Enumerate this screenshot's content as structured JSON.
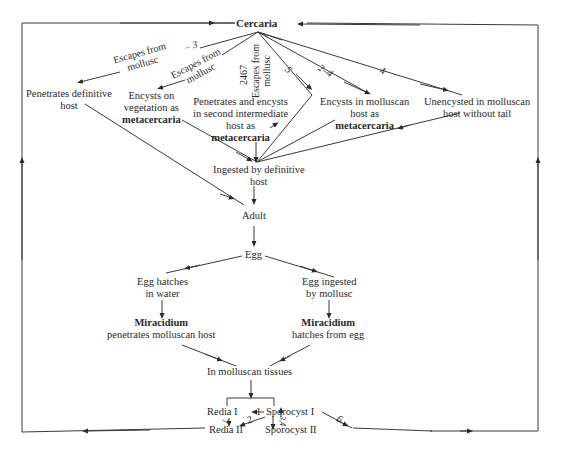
{
  "diagram": {
    "title_node": "Cercaria",
    "nodes": {
      "penetrates_definitive": [
        "Penetrates definitive",
        "host"
      ],
      "encysts_vegetation": [
        "Encysts on",
        "vegetation as"
      ],
      "encysts_vegetation_bold": "metacercaria",
      "penetrates_second": [
        "Penetrates and encysts",
        "in second intermediate",
        "host as"
      ],
      "penetrates_second_bold": "metacercaria",
      "encysts_molluscan": [
        "Encysts in molluscan",
        "host as"
      ],
      "encysts_molluscan_bold": "metacercaria",
      "unencysted": [
        "Unencysted in molluscan",
        "host without tail"
      ],
      "ingested": [
        "Ingested by definitive",
        "host"
      ],
      "adult": "Adult",
      "egg": "Egg",
      "egg_hatches": [
        "Egg hatches",
        "in water"
      ],
      "egg_ingested": [
        "Egg ingested",
        "by mollusc"
      ],
      "miracidium_left_bold": "Miracidium",
      "miracidium_left": "penetrates molluscan host",
      "miracidium_right_bold": "Miracidium",
      "miracidium_right": "hatches from egg",
      "molluscan_tissues": "In molluscan tissues",
      "redia1": "Redia I",
      "sporocyst1": "Sporocyst I",
      "redia2": "Redia II",
      "sporocyst2": "Sporocyst II"
    },
    "edge_labels": {
      "escapes1": [
        "Escapes from",
        "mollusc"
      ],
      "escapes1_num": "3",
      "escapes2": [
        "Escapes from",
        "mollusc"
      ],
      "escapes3": [
        "Escapes from",
        "mollusc"
      ],
      "escapes3_num": "2467",
      "n5": "5",
      "n2_4": "2–4",
      "n4": "4",
      "r_1": "1",
      "r_2": "2",
      "r_7": "7",
      "r_34": "3,4",
      "r_6": "6"
    }
  }
}
